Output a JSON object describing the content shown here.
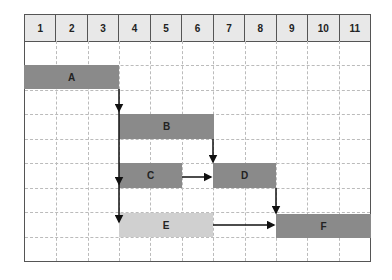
{
  "columns": [
    "1",
    "2",
    "3",
    "4",
    "5",
    "6",
    "7",
    "8",
    "9",
    "10",
    "11"
  ],
  "rows": 9,
  "tasks": [
    {
      "label": "A",
      "start": 1,
      "end": 3,
      "row": 2,
      "color": "#8a8a8a"
    },
    {
      "label": "B",
      "start": 4,
      "end": 6,
      "row": 4,
      "color": "#8a8a8a"
    },
    {
      "label": "C",
      "start": 4,
      "end": 5,
      "row": 6,
      "color": "#8a8a8a"
    },
    {
      "label": "D",
      "start": 7,
      "end": 8,
      "row": 6,
      "color": "#8a8a8a"
    },
    {
      "label": "E",
      "start": 4,
      "end": 6,
      "row": 8,
      "color": "#d0d0d0"
    },
    {
      "label": "F",
      "start": 9,
      "end": 11,
      "row": 8,
      "color": "#8a8a8a"
    }
  ],
  "dependencies": [
    {
      "from": "A",
      "to": "B"
    },
    {
      "from": "A",
      "to": "C"
    },
    {
      "from": "A",
      "to": "E"
    },
    {
      "from": "B",
      "to": "D"
    },
    {
      "from": "C",
      "to": "D"
    },
    {
      "from": "D",
      "to": "F"
    },
    {
      "from": "E",
      "to": "F"
    }
  ]
}
